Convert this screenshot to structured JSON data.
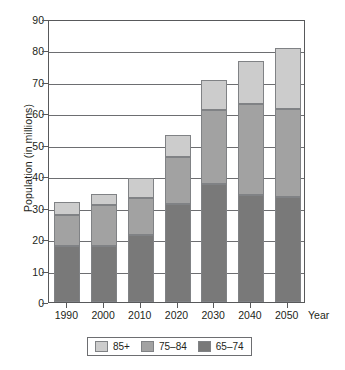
{
  "chart_data": {
    "type": "bar",
    "subtype": "stacked-vertical-bar",
    "title": "",
    "xlabel": "Year",
    "ylabel": "Population (in millions)",
    "categories": [
      "1990",
      "2000",
      "2010",
      "2020",
      "2030",
      "2040",
      "2050"
    ],
    "series": [
      {
        "name": "65-74",
        "label": "65–74",
        "color": "#797979",
        "values": [
          17.8,
          17.9,
          21.3,
          31.3,
          37.5,
          33.9,
          33.5
        ]
      },
      {
        "name": "75-84",
        "label": "75–84",
        "color": "#a2a2a2",
        "values": [
          10.0,
          13.1,
          11.9,
          14.7,
          23.7,
          29.0,
          28.0
        ]
      },
      {
        "name": "85+",
        "label": "85+",
        "color": "#cccccc",
        "values": [
          4.0,
          3.4,
          6.4,
          7.1,
          9.3,
          13.9,
          19.3
        ]
      }
    ],
    "totals": [
      31.8,
      34.4,
      39.6,
      53.1,
      70.5,
      76.8,
      80.8
    ],
    "ylim": [
      0,
      90
    ],
    "ytick_labels": [
      "0",
      "10",
      "20",
      "30",
      "40",
      "50",
      "60",
      "70",
      "80",
      "90"
    ],
    "ytick_values": [
      0,
      10,
      20,
      30,
      40,
      50,
      60,
      70,
      80,
      90
    ],
    "grid": true,
    "grid_axis": "y",
    "legend_position": "bottom",
    "legend_entries": [
      "85+",
      "75–84",
      "65–74"
    ],
    "stack_order_bottom_to_top": [
      "65–74",
      "75–84",
      "85+"
    ]
  },
  "axes": {
    "y_title": "Population (in millions)",
    "x_title": "Year"
  },
  "legend": {
    "items": [
      {
        "label": "85+",
        "swatch": "s85"
      },
      {
        "label": "75–84",
        "swatch": "s7584"
      },
      {
        "label": "65–74",
        "swatch": "s6574"
      }
    ]
  }
}
